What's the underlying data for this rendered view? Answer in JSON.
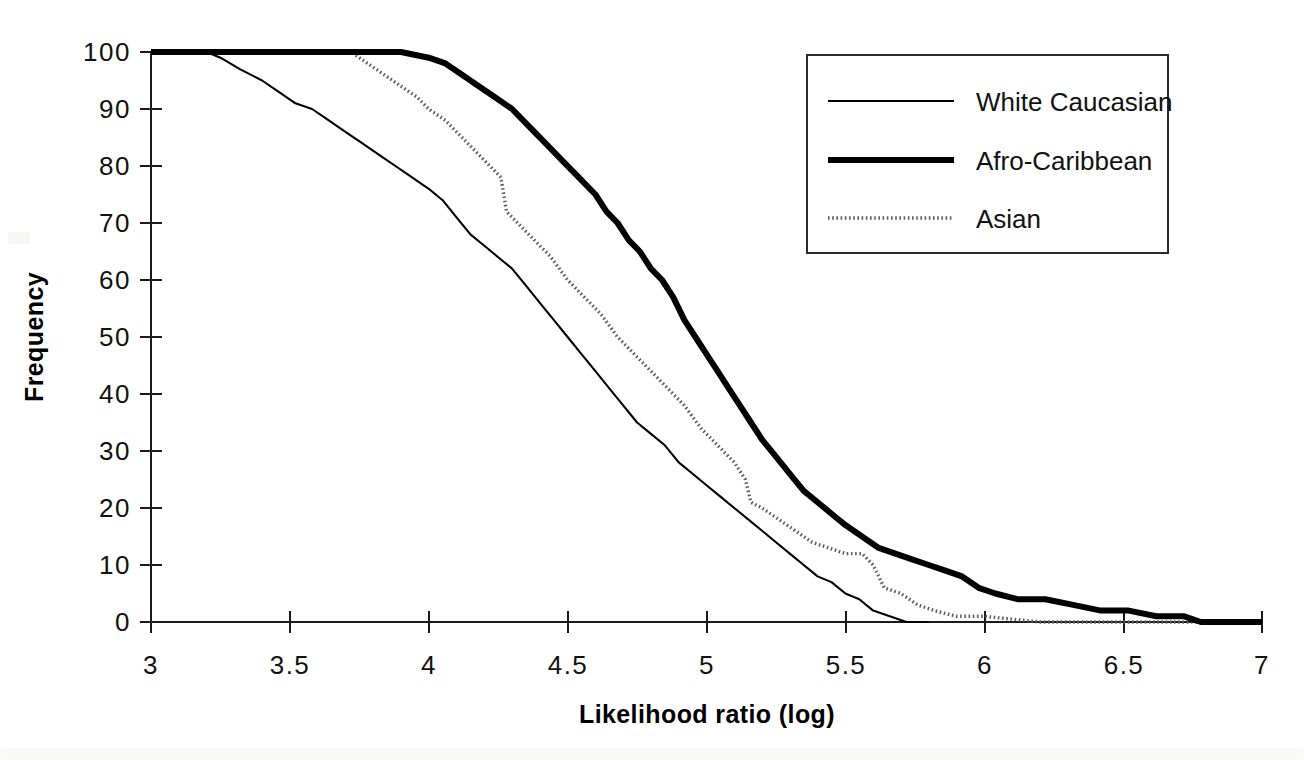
{
  "chart_data": {
    "type": "line",
    "title": "",
    "xlabel": "Likelihood ratio (log)",
    "ylabel": "Frequency",
    "xlim": [
      3,
      7
    ],
    "ylim": [
      0,
      100
    ],
    "grid": false,
    "legend_position": "top-right",
    "x_ticks": [
      "3",
      "3.5",
      "4",
      "4.5",
      "5",
      "5.5",
      "6",
      "6.5",
      "7"
    ],
    "x_tick_values": [
      3,
      3.5,
      4,
      4.5,
      5,
      5.5,
      6,
      6.5,
      7
    ],
    "y_ticks": [
      "0",
      "10",
      "20",
      "30",
      "40",
      "50",
      "60",
      "70",
      "80",
      "90",
      "100"
    ],
    "y_tick_values": [
      0,
      10,
      20,
      30,
      40,
      50,
      60,
      70,
      80,
      90,
      100
    ],
    "series": [
      {
        "name": "White Caucasian",
        "style": "thin-solid",
        "color": "#000000",
        "points": [
          [
            3.0,
            100
          ],
          [
            3.1,
            100
          ],
          [
            3.2,
            100
          ],
          [
            3.25,
            99
          ],
          [
            3.32,
            97
          ],
          [
            3.4,
            95
          ],
          [
            3.46,
            93
          ],
          [
            3.52,
            91
          ],
          [
            3.58,
            90
          ],
          [
            3.64,
            88
          ],
          [
            3.7,
            86
          ],
          [
            3.76,
            84
          ],
          [
            3.82,
            82
          ],
          [
            3.88,
            80
          ],
          [
            3.94,
            78
          ],
          [
            4.0,
            76
          ],
          [
            4.05,
            74
          ],
          [
            4.1,
            71
          ],
          [
            4.15,
            68
          ],
          [
            4.2,
            66
          ],
          [
            4.25,
            64
          ],
          [
            4.3,
            62
          ],
          [
            4.35,
            59
          ],
          [
            4.4,
            56
          ],
          [
            4.45,
            53
          ],
          [
            4.5,
            50
          ],
          [
            4.55,
            47
          ],
          [
            4.6,
            44
          ],
          [
            4.65,
            41
          ],
          [
            4.7,
            38
          ],
          [
            4.75,
            35
          ],
          [
            4.8,
            33
          ],
          [
            4.85,
            31
          ],
          [
            4.9,
            28
          ],
          [
            4.95,
            26
          ],
          [
            5.0,
            24
          ],
          [
            5.05,
            22
          ],
          [
            5.1,
            20
          ],
          [
            5.15,
            18
          ],
          [
            5.2,
            16
          ],
          [
            5.25,
            14
          ],
          [
            5.3,
            12
          ],
          [
            5.35,
            10
          ],
          [
            5.4,
            8
          ],
          [
            5.45,
            7
          ],
          [
            5.5,
            5
          ],
          [
            5.55,
            4
          ],
          [
            5.6,
            2
          ],
          [
            5.66,
            1
          ],
          [
            5.72,
            0
          ],
          [
            5.8,
            0
          ]
        ]
      },
      {
        "name": "Afro-Caribbean",
        "style": "thick-solid",
        "color": "#000000",
        "points": [
          [
            3.0,
            100
          ],
          [
            3.3,
            100
          ],
          [
            3.6,
            100
          ],
          [
            3.9,
            100
          ],
          [
            4.0,
            99
          ],
          [
            4.06,
            98
          ],
          [
            4.12,
            96
          ],
          [
            4.18,
            94
          ],
          [
            4.24,
            92
          ],
          [
            4.3,
            90
          ],
          [
            4.36,
            87
          ],
          [
            4.42,
            84
          ],
          [
            4.48,
            81
          ],
          [
            4.54,
            78
          ],
          [
            4.6,
            75
          ],
          [
            4.64,
            72
          ],
          [
            4.68,
            70
          ],
          [
            4.72,
            67
          ],
          [
            4.76,
            65
          ],
          [
            4.8,
            62
          ],
          [
            4.84,
            60
          ],
          [
            4.88,
            57
          ],
          [
            4.92,
            53
          ],
          [
            4.96,
            50
          ],
          [
            5.0,
            47
          ],
          [
            5.04,
            44
          ],
          [
            5.08,
            41
          ],
          [
            5.12,
            38
          ],
          [
            5.16,
            35
          ],
          [
            5.2,
            32
          ],
          [
            5.25,
            29
          ],
          [
            5.3,
            26
          ],
          [
            5.35,
            23
          ],
          [
            5.4,
            21
          ],
          [
            5.45,
            19
          ],
          [
            5.5,
            17
          ],
          [
            5.56,
            15
          ],
          [
            5.62,
            13
          ],
          [
            5.68,
            12
          ],
          [
            5.74,
            11
          ],
          [
            5.8,
            10
          ],
          [
            5.86,
            9
          ],
          [
            5.92,
            8
          ],
          [
            5.98,
            6
          ],
          [
            6.04,
            5
          ],
          [
            6.12,
            4
          ],
          [
            6.22,
            4
          ],
          [
            6.32,
            3
          ],
          [
            6.42,
            2
          ],
          [
            6.52,
            2
          ],
          [
            6.62,
            1
          ],
          [
            6.72,
            1
          ],
          [
            6.78,
            0
          ],
          [
            7.0,
            0
          ]
        ]
      },
      {
        "name": "Asian",
        "style": "dotted",
        "color": "#5d5d5d",
        "points": [
          [
            3.0,
            100
          ],
          [
            3.3,
            100
          ],
          [
            3.6,
            100
          ],
          [
            3.72,
            100
          ],
          [
            3.78,
            98
          ],
          [
            3.84,
            96
          ],
          [
            3.9,
            94
          ],
          [
            3.96,
            92
          ],
          [
            4.0,
            90
          ],
          [
            4.06,
            88
          ],
          [
            4.12,
            85
          ],
          [
            4.18,
            82
          ],
          [
            4.22,
            80
          ],
          [
            4.26,
            78
          ],
          [
            4.28,
            72
          ],
          [
            4.32,
            70
          ],
          [
            4.38,
            67
          ],
          [
            4.44,
            64
          ],
          [
            4.5,
            60
          ],
          [
            4.56,
            57
          ],
          [
            4.62,
            54
          ],
          [
            4.68,
            50
          ],
          [
            4.74,
            47
          ],
          [
            4.8,
            44
          ],
          [
            4.86,
            41
          ],
          [
            4.92,
            38
          ],
          [
            4.98,
            34
          ],
          [
            5.04,
            31
          ],
          [
            5.1,
            28
          ],
          [
            5.14,
            25
          ],
          [
            5.16,
            21
          ],
          [
            5.2,
            20
          ],
          [
            5.26,
            18
          ],
          [
            5.32,
            16
          ],
          [
            5.38,
            14
          ],
          [
            5.44,
            13
          ],
          [
            5.5,
            12
          ],
          [
            5.56,
            12
          ],
          [
            5.6,
            10
          ],
          [
            5.64,
            6
          ],
          [
            5.7,
            5
          ],
          [
            5.76,
            3
          ],
          [
            5.82,
            2
          ],
          [
            5.9,
            1
          ],
          [
            6.0,
            1
          ],
          [
            6.2,
            0
          ],
          [
            6.5,
            0
          ],
          [
            6.8,
            0
          ],
          [
            7.0,
            0
          ]
        ]
      }
    ],
    "legend_entries": [
      {
        "label": "White Caucasian",
        "style": "thin-solid"
      },
      {
        "label": "Afro-Caribbean",
        "style": "thick-solid"
      },
      {
        "label": "Asian",
        "style": "dotted"
      }
    ]
  },
  "axis": {
    "x_label": "Likelihood ratio (log)",
    "y_label": "Frequency"
  },
  "legend": {
    "entry_0_label": "White Caucasian",
    "entry_1_label": "Afro-Caribbean",
    "entry_2_label": "Asian"
  },
  "x_tick_labels": {
    "t0": "3",
    "t1": "3.5",
    "t2": "4",
    "t3": "4.5",
    "t4": "5",
    "t5": "5.5",
    "t6": "6",
    "t7": "6.5",
    "t8": "7"
  },
  "y_tick_labels": {
    "t0": "0",
    "t1": "10",
    "t2": "20",
    "t3": "30",
    "t4": "40",
    "t5": "50",
    "t6": "60",
    "t7": "70",
    "t8": "80",
    "t9": "90",
    "t10": "100"
  },
  "colors": {
    "ink": "#000000",
    "dotted_series": "#5d5d5d",
    "background": "#ffffff"
  }
}
